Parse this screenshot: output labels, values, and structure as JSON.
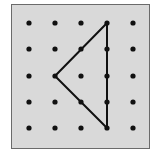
{
  "board": {
    "background": "#d9d9d9",
    "border": "#6b6b6b",
    "dot_color": "#111111",
    "line_color": "#111111",
    "rows": 5,
    "cols": 5
  },
  "grid_x": [
    29,
    55,
    81,
    107,
    133
  ],
  "grid_y": [
    23,
    49,
    76,
    102,
    128
  ],
  "triangle": {
    "vertices": [
      [
        3,
        0
      ],
      [
        1,
        2
      ],
      [
        3,
        4
      ]
    ],
    "description": "Triangle on geoboard with vertices at column 4 row 1, column 2 row 3, column 4 row 5"
  }
}
